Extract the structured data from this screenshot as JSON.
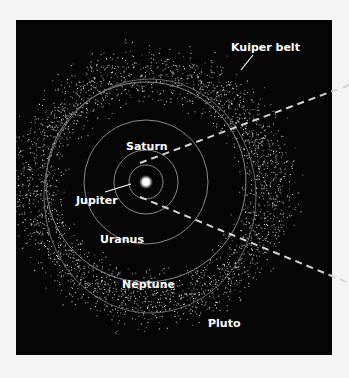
{
  "diagram": {
    "colors": {
      "page_background": "#f4f4f2",
      "space_background": "#050505",
      "orbit": "#8a8a8a",
      "label": "#ffffff",
      "dust": "#d8d8d8",
      "dashed_line": "#d0d0d0"
    },
    "sun": {
      "x": 146,
      "y": 182
    },
    "labels": {
      "kuiper_belt": "Kuiper belt",
      "saturn": "Saturn",
      "jupiter": "Jupiter",
      "uranus": "Uranus",
      "neptune": "Neptune",
      "pluto": "Pluto"
    },
    "orbits": [
      {
        "name": "Jupiter",
        "rx": 17,
        "ry": 17
      },
      {
        "name": "Saturn",
        "rx": 32,
        "ry": 32
      },
      {
        "name": "Uranus",
        "rx": 62,
        "ry": 62
      },
      {
        "name": "Neptune",
        "rx": 100,
        "ry": 100
      },
      {
        "name": "Pluto",
        "rx": 122,
        "ry": 112
      }
    ]
  }
}
